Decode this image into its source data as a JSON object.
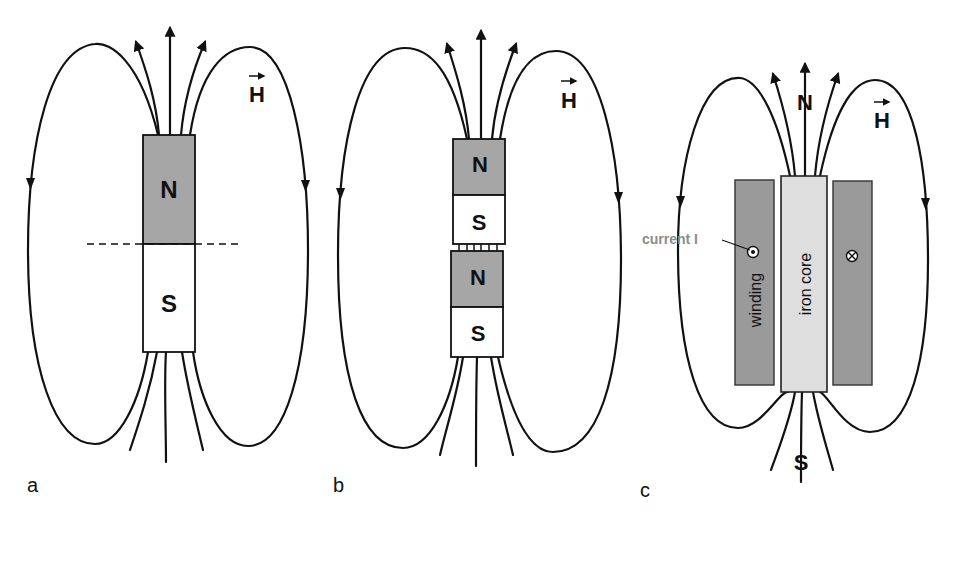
{
  "figure": {
    "panels": [
      {
        "id": "a",
        "label": "a",
        "field_label": "H",
        "magnet": {
          "north": "N",
          "south": "S"
        },
        "cut_line": "dashed"
      },
      {
        "id": "b",
        "label": "b",
        "field_label": "H",
        "magnets": [
          {
            "north": "N",
            "south": "S"
          },
          {
            "north": "N",
            "south": "S"
          }
        ]
      },
      {
        "id": "c",
        "label": "c",
        "field_label": "H",
        "pole_top": "N",
        "pole_bottom": "S",
        "core_label": "iron core",
        "winding_label": "winding",
        "current_label": "current I",
        "current_out_symbol": "⊙",
        "current_in_symbol": "⊗"
      }
    ],
    "colors": {
      "north_fill": "#a6a6a6",
      "south_fill": "#ffffff",
      "winding_fill": "#9a9a9a",
      "core_fill": "#dedede",
      "line": "#111111",
      "current_label": "#8c8c8c"
    }
  }
}
